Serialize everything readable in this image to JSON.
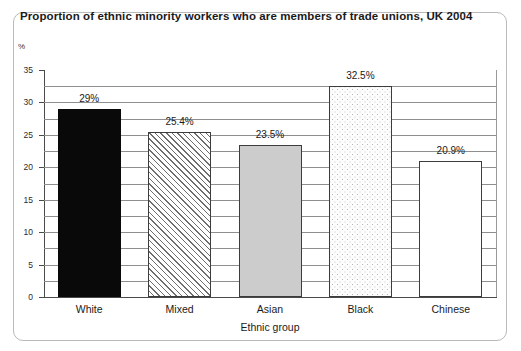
{
  "chart_data": {
    "type": "bar",
    "title": "Proportion of ethnic minority workers who are members of trade unions, UK 2004",
    "categories": [
      "White",
      "Mixed",
      "Asian",
      "Black",
      "Chinese"
    ],
    "values": [
      29,
      25.4,
      23.5,
      32.5,
      20.9
    ],
    "data_labels": [
      "29%",
      "25.4%",
      "23.5%",
      "32.5%",
      "20.9%"
    ],
    "xlabel": "Ethnic group",
    "ylabel": "%",
    "ylim": [
      0,
      35
    ],
    "y_major_ticks": [
      0,
      5,
      10,
      15,
      20,
      25,
      30,
      35
    ],
    "y_tick_labels": [
      "0",
      "5",
      "10",
      "15",
      "20",
      "25",
      "30",
      "35"
    ],
    "y_gridlines": [
      2.5,
      5,
      7.5,
      10,
      12.5,
      15,
      17.5,
      20,
      22.5,
      25,
      27.5,
      30,
      32.5
    ],
    "grid": true,
    "legend": "none",
    "bar_fills": [
      "solid-black",
      "diagonal-hatch",
      "light-gray",
      "stipple-dots",
      "white"
    ],
    "colors": {
      "bar_black": "#090909",
      "bar_gray": "#cccccc",
      "bar_white": "#ffffff",
      "axis": "#4a4a4a",
      "gridline": "#8f8f8f",
      "frame": "#b9b9b9",
      "text": "#1a1a1a"
    }
  }
}
